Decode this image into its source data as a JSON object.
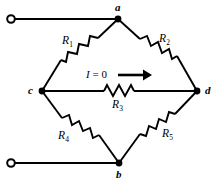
{
  "figure": {
    "kind": "circuit-schematic",
    "name": "Wheatstone bridge",
    "width": 218,
    "height": 185,
    "background_color": "#ffffff",
    "line_color": "#000000"
  },
  "nodes": [
    {
      "id": "a",
      "label": "a",
      "x": 118,
      "y": 19,
      "label_x": 115,
      "label_y": 4
    },
    {
      "id": "b",
      "label": "b",
      "x": 119,
      "y": 163,
      "label_x": 116,
      "label_y": 170
    },
    {
      "id": "c",
      "label": "c",
      "x": 42,
      "y": 91,
      "label_x": 28,
      "label_y": 86
    },
    {
      "id": "d",
      "label": "d",
      "x": 197,
      "y": 91,
      "label_x": 205,
      "label_y": 86
    }
  ],
  "terminals": [
    {
      "id": "top-terminal",
      "label": "",
      "x": 11,
      "y": 19,
      "radius": 4
    },
    {
      "id": "bottom-terminal",
      "label": "",
      "x": 11,
      "y": 163,
      "radius": 4
    }
  ],
  "resistors": [
    {
      "id": "R1",
      "label": "R",
      "subscript": "1",
      "between": "a-c",
      "label_x": 64,
      "label_y": 36
    },
    {
      "id": "R2",
      "label": "R",
      "subscript": "2",
      "between": "a-d",
      "label_x": 160,
      "label_y": 34
    },
    {
      "id": "R3",
      "label": "R",
      "subscript": "3",
      "between": "c-d",
      "label_x": 113,
      "label_y": 99
    },
    {
      "id": "R4",
      "label": "R",
      "subscript": "4",
      "between": "c-b",
      "label_x": 60,
      "label_y": 131
    },
    {
      "id": "R5",
      "label": "R",
      "subscript": "5",
      "between": "b-d",
      "label_x": 162,
      "label_y": 129
    }
  ],
  "annotations": [
    {
      "id": "bridge-current",
      "symbol": "I",
      "equals": " = ",
      "value": "0",
      "text": "I = 0",
      "label_x": 88,
      "label_y": 70,
      "arrow": {
        "id": "current-arrow",
        "x1": 118,
        "y1": 75,
        "x2": 150,
        "y2": 75,
        "direction": "right"
      }
    }
  ]
}
